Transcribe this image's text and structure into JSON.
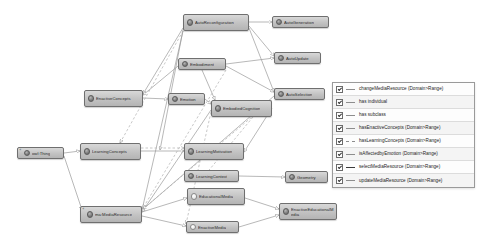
{
  "diagram": {
    "background": "#ffffff",
    "node_fill": "#c6c6c6",
    "node_border": "#6f6f6f",
    "edge_color": "#8d8d8d",
    "nodes": [
      {
        "id": "autoreconfiguration",
        "label": "AutoReconfiguration",
        "icon": "filled-circle-icon",
        "marker": "",
        "x": 183,
        "y": 14,
        "w": 66,
        "h": 17
      },
      {
        "id": "autogeneration",
        "label": "AutoGeneration",
        "icon": "filled-circle-icon",
        "marker": "",
        "x": 272,
        "y": 16,
        "w": 57,
        "h": 12
      },
      {
        "id": "autoupdate",
        "label": "AutoUpdate",
        "icon": "filled-circle-icon",
        "marker": "",
        "x": 274,
        "y": 52,
        "w": 47,
        "h": 12
      },
      {
        "id": "embodiment",
        "label": "Embodiment",
        "icon": "filled-circle-icon",
        "marker": "",
        "x": 178,
        "y": 58,
        "w": 48,
        "h": 12
      },
      {
        "id": "autoselection",
        "label": "AutoSelection",
        "icon": "filled-circle-icon",
        "marker": "",
        "x": 274,
        "y": 88,
        "w": 51,
        "h": 12
      },
      {
        "id": "enactiveconcepts",
        "label": "EnactiveConcepts",
        "icon": "filled-circle-icon",
        "marker": "",
        "x": 84,
        "y": 90,
        "w": 59,
        "h": 17
      },
      {
        "id": "emotion",
        "label": "Emotion",
        "icon": "filled-circle-icon",
        "marker": "",
        "x": 168,
        "y": 93,
        "w": 37,
        "h": 12
      },
      {
        "id": "embodiedcognition",
        "label": "EmbodiedCognition",
        "icon": "filled-circle-icon",
        "marker": "",
        "x": 211,
        "y": 100,
        "w": 61,
        "h": 17
      },
      {
        "id": "owlthing",
        "label": "owl:Thing",
        "icon": "filled-circle-icon",
        "marker": "«",
        "x": 17,
        "y": 147,
        "w": 47,
        "h": 12
      },
      {
        "id": "learningconcepts",
        "label": "LearningConcepts",
        "icon": "filled-circle-icon",
        "marker": "",
        "x": 80,
        "y": 143,
        "w": 61,
        "h": 17
      },
      {
        "id": "learningmotivation",
        "label": "LearningMotivation",
        "icon": "filled-circle-icon",
        "marker": "",
        "x": 184,
        "y": 143,
        "w": 60,
        "h": 17
      },
      {
        "id": "learningcontext",
        "label": "LearningContext",
        "icon": "filled-circle-icon",
        "marker": "",
        "x": 184,
        "y": 170,
        "w": 55,
        "h": 12
      },
      {
        "id": "geometry",
        "label": "Geometry",
        "icon": "filled-circle-icon",
        "marker": "",
        "x": 285,
        "y": 171,
        "w": 43,
        "h": 12
      },
      {
        "id": "educationalmedia",
        "label": "EducationalMedia",
        "icon": "hollow-circle-icon",
        "marker": "",
        "x": 187,
        "y": 188,
        "w": 58,
        "h": 17
      },
      {
        "id": "mamediaresource",
        "label": "ma:MediaResource",
        "icon": "filled-circle-icon",
        "marker": "«",
        "x": 80,
        "y": 206,
        "w": 62,
        "h": 17
      },
      {
        "id": "enactiveeducationalmedia",
        "label": "EnactiveEducationalMedia",
        "icon": "filled-circle-icon",
        "marker": "",
        "x": 279,
        "y": 203,
        "w": 58,
        "h": 17
      },
      {
        "id": "enactivemedia",
        "label": "EnactiveMedia",
        "icon": "hollow-circle-icon",
        "marker": "",
        "x": 186,
        "y": 221,
        "w": 53,
        "h": 12
      }
    ]
  },
  "legend": {
    "items": [
      {
        "label": "changeMediaResource (Domain>Range)",
        "checked": true,
        "style": "solid"
      },
      {
        "label": "has individual",
        "checked": true,
        "style": "solid"
      },
      {
        "label": "has subclass",
        "checked": true,
        "style": "solid"
      },
      {
        "label": "hasEnactiveConcepts (Domain>Range)",
        "checked": true,
        "style": "solid"
      },
      {
        "label": "hasLearningConcepts (Domain>Range)",
        "checked": true,
        "style": "dashed"
      },
      {
        "label": "isAffectedbyEmotion (Domain>Range)",
        "checked": true,
        "style": "solid"
      },
      {
        "label": "selectMediaResource (Domain>Range)",
        "checked": true,
        "style": "bold"
      },
      {
        "label": "updateMediaResource (Domain>Range)",
        "checked": true,
        "style": "solid"
      }
    ]
  }
}
